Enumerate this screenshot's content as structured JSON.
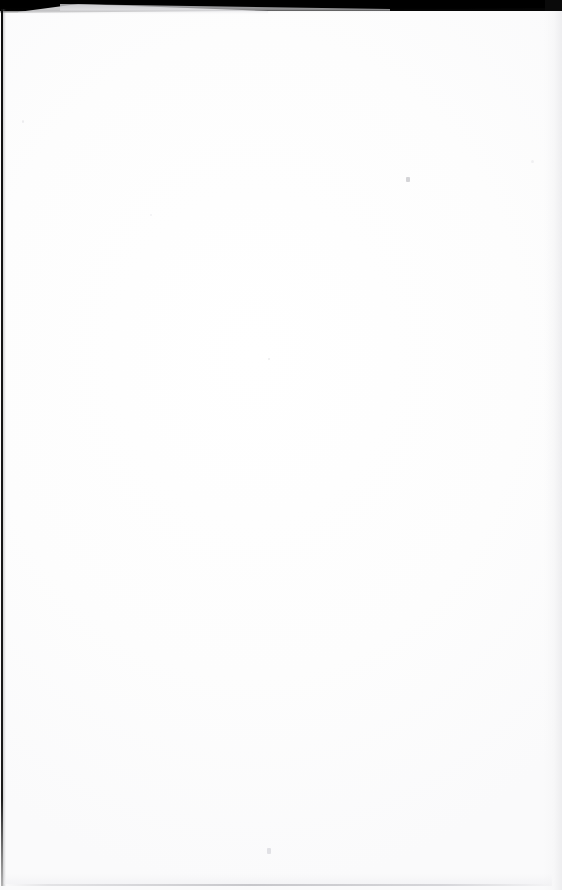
{
  "document": {
    "kind": "scanned-book-page",
    "page_content": "",
    "page_text_lines": [],
    "description_visible_text": "",
    "is_blank": "true"
  },
  "scan_artifacts": {
    "top_band": {
      "name": "scanner-background-band",
      "color": "#050505",
      "height_px": "11"
    },
    "page_edge_sliver": {
      "name": "underlying-page-edge",
      "color": "#d6d6d9"
    },
    "gutter_line": {
      "name": "left-page-edge-line",
      "color": "#141414"
    },
    "bottom_line": {
      "name": "bottom-page-edge-line",
      "color": "#babac0"
    },
    "right_gap": {
      "name": "right-margin-gap",
      "color": "#ececee"
    },
    "paper": {
      "name": "paper-surface",
      "color": "#fefefe"
    }
  },
  "canvas": {
    "width": "562",
    "height": "890"
  }
}
